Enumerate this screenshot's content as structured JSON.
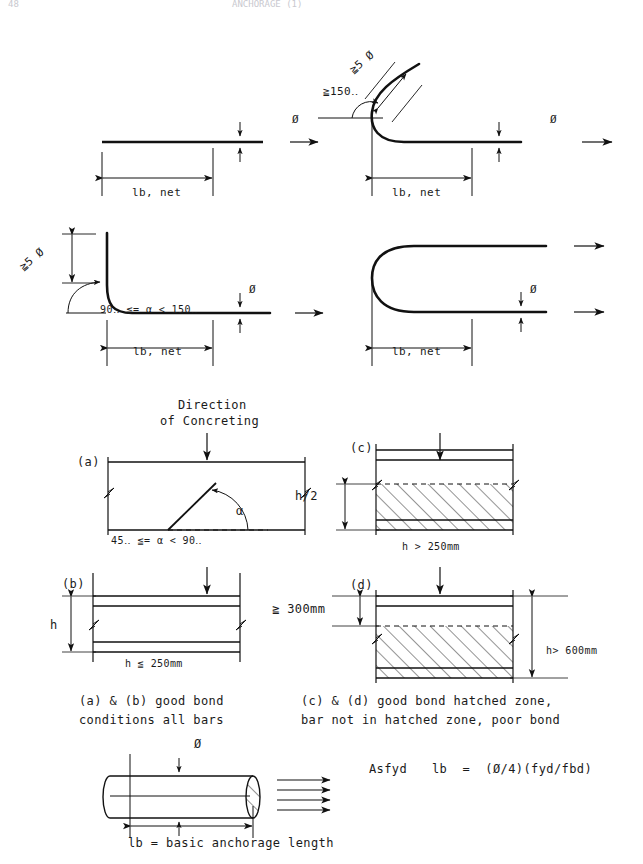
{
  "page": {
    "header_left": "48",
    "header_center": "ANCHORAGE (1)",
    "width": 643,
    "height": 864,
    "ink_color": "#111111",
    "paper_color": "#ffffff"
  },
  "figure_top": {
    "title": "Anchorage of longitudinal reinforcement — hook, bend and loop details",
    "rows": [
      {
        "id": "row-1",
        "panels": [
          {
            "id": "straight-bar",
            "type": "straight",
            "labels": {
              "diameter": "Ø",
              "length": "lb, net"
            }
          },
          {
            "id": "hook-bar",
            "type": "hook",
            "labels": {
              "hook_extension": "≧5 Ø",
              "hook_angle": "≧150‥",
              "diameter": "Ø",
              "length": "lb, net"
            }
          }
        ]
      },
      {
        "id": "row-2",
        "panels": [
          {
            "id": "bend-bar",
            "type": "bend",
            "labels": {
              "bend_extension": "≧5 Ø",
              "bend_angle": "90‥ ≦= α < 150‥",
              "diameter": "Ø",
              "length": "lb, net"
            }
          },
          {
            "id": "loop-bar",
            "type": "loop",
            "labels": {
              "diameter": "Ø",
              "length": "lb, net"
            }
          }
        ]
      }
    ]
  },
  "figure_bond": {
    "direction_label_line1": "Direction",
    "direction_label_line2": "of Concreting",
    "panels": [
      {
        "id": "panel-a",
        "tag": "(a)",
        "angle_symbol": "α",
        "caption": "45‥ ≦= α < 90‥",
        "hatched": false
      },
      {
        "id": "panel-b",
        "tag": "(b)",
        "height_symbol": "h",
        "caption": "h ≦ 250mm",
        "hatched": false
      },
      {
        "id": "panel-c",
        "tag": "(c)",
        "zone_dim": "h/2",
        "caption": "h > 250mm",
        "hatched": true
      },
      {
        "id": "panel-d",
        "tag": "(d)",
        "zone_dim": "≧ 300mm",
        "total_height": "h> 600mm",
        "caption": "",
        "hatched": true
      }
    ],
    "captions": {
      "left_line1": "(a) & (b) good bond",
      "left_line2": "conditions all bars",
      "right_line1": "(c) & (d) good bond hatched zone,",
      "right_line2": "bar not in hatched zone, poor bond"
    }
  },
  "figure_bottom": {
    "bar_diameter_label": "Ø",
    "formula_prefix": "Asfyd",
    "formula": "lb  =  (Ø/4)(fyd/fbd)",
    "length_caption": "lb = basic anchorage length"
  }
}
